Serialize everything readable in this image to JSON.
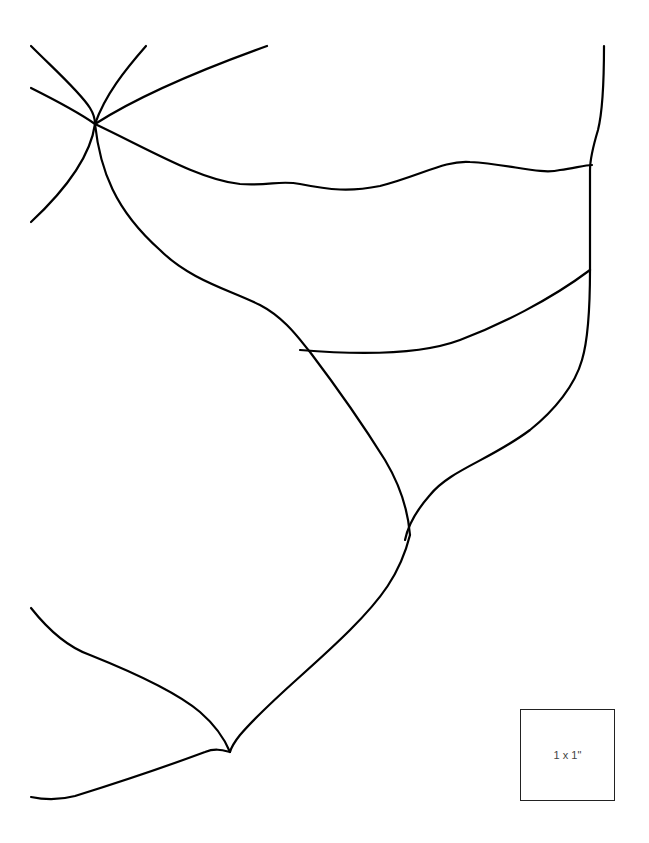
{
  "diagram": {
    "type": "line-pattern-template",
    "stroke_color": "#000000",
    "background": "#ffffff",
    "scale_reference": {
      "label": "1 x 1\""
    }
  }
}
